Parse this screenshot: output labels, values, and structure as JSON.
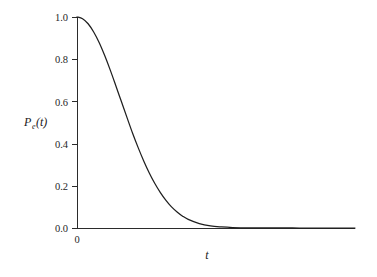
{
  "figure": {
    "background_color": "#ffffff",
    "curve_color": "#1f1f1f",
    "axis_color": "#2b2b2b"
  },
  "axes": {
    "y_label_main": "P",
    "y_label_subscript": "e",
    "y_label_arg": "(t)",
    "x_label": "t",
    "x_origin_label": "0",
    "y_tick_labels": [
      "0.0",
      "0.2",
      "0.4",
      "0.6",
      "0.8",
      "1.0"
    ]
  },
  "chart_data": {
    "type": "line",
    "title": "",
    "xlabel": "t",
    "ylabel": "P_e(t)",
    "legend": [],
    "grid": false,
    "xlim": [
      0,
      10
    ],
    "ylim": [
      0.0,
      1.0
    ],
    "yticks": [
      0.0,
      0.2,
      0.4,
      0.6,
      0.8,
      1.0
    ],
    "ytick_labels": [
      "0.0",
      "0.2",
      "0.4",
      "0.6",
      "0.8",
      "1.0"
    ],
    "xticks": [
      0
    ],
    "xtick_labels": [
      "0"
    ],
    "series": [
      {
        "name": "P_e(t)",
        "color": "#1f1f1f",
        "x": [
          0.0,
          0.2,
          0.4,
          0.6,
          0.8,
          1.0,
          1.2,
          1.4,
          1.6,
          1.8,
          2.0,
          2.2,
          2.4,
          2.6,
          2.8,
          3.0,
          3.2,
          3.4,
          3.6,
          3.8,
          4.0,
          4.4,
          4.8,
          5.2,
          5.6,
          6.0,
          6.5,
          7.0,
          7.5,
          8.0,
          8.5,
          9.0,
          9.5,
          10.0
        ],
        "y": [
          1.0,
          0.992,
          0.968,
          0.929,
          0.878,
          0.816,
          0.747,
          0.673,
          0.598,
          0.523,
          0.449,
          0.381,
          0.318,
          0.261,
          0.211,
          0.168,
          0.131,
          0.1,
          0.076,
          0.056,
          0.041,
          0.021,
          0.01,
          0.005,
          0.002,
          0.001,
          0.0004,
          0.0001,
          5e-05,
          0.0,
          0.0,
          0.0,
          0.0,
          0.0
        ]
      }
    ]
  },
  "geometry": {
    "origin_x": 77,
    "origin_y": 228,
    "x_axis_end": 355,
    "y_axis_top": 17
  }
}
